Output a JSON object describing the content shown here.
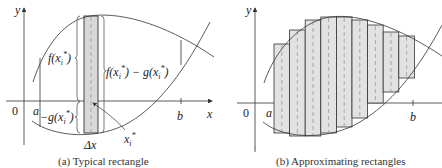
{
  "figures": [
    {
      "id": "a",
      "caption": "(a) Typical rectangle",
      "labels": {
        "y_axis": "y",
        "x_axis": "x",
        "origin": "0",
        "a": "a",
        "b": "b",
        "f_label": "f(x",
        "g_label": "−g(x",
        "diff_label_f": "f(x",
        "diff_label_mid": ") − g(x",
        "sub_i": "i",
        "sup_star": "*",
        "close_paren": ")",
        "xi_label": "x",
        "delta_x": "Δx"
      }
    },
    {
      "id": "b",
      "caption": "(b) Approximating rectangles",
      "labels": {
        "y_axis": "y",
        "x_axis": "x",
        "origin": "0",
        "a": "a",
        "b": "b"
      },
      "rectangles": 9
    }
  ],
  "colors": {
    "rect_fill": "#e4e4e4",
    "stroke": "#333333",
    "dashed": "#9a9a9a"
  }
}
